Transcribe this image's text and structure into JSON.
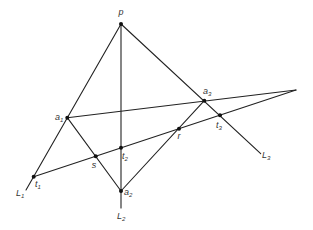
{
  "diagram": {
    "type": "projective-geometry-construction",
    "points": [
      {
        "id": "p",
        "label": "p",
        "sub": "",
        "x": 121,
        "y": 24,
        "lx": 121,
        "ly": 15,
        "anchor": "middle"
      },
      {
        "id": "a1",
        "label": "a",
        "sub": "1",
        "x": 67.3,
        "y": 117.7,
        "lx": 55,
        "ly": 120,
        "anchor": "start"
      },
      {
        "id": "a2",
        "label": "a",
        "sub": "2",
        "x": 121,
        "y": 191,
        "lx": 124,
        "ly": 195,
        "anchor": "start"
      },
      {
        "id": "a3",
        "label": "a",
        "sub": "3",
        "x": 204.3,
        "y": 100.7,
        "lx": 203,
        "ly": 94,
        "anchor": "start"
      },
      {
        "id": "t1",
        "label": "t",
        "sub": "1",
        "x": 33.7,
        "y": 176.7,
        "lx": 35,
        "ly": 187,
        "anchor": "start"
      },
      {
        "id": "t2",
        "label": "t",
        "sub": "2",
        "x": 121,
        "y": 147.7,
        "lx": 122,
        "ly": 159,
        "anchor": "start"
      },
      {
        "id": "t3",
        "label": "t",
        "sub": "3",
        "x": 220,
        "y": 115.3,
        "lx": 216,
        "ly": 128,
        "anchor": "start"
      },
      {
        "id": "s",
        "label": "s",
        "sub": "",
        "x": 95.7,
        "y": 156.3,
        "lx": 94,
        "ly": 168,
        "anchor": "middle"
      },
      {
        "id": "r",
        "label": "r",
        "sub": "",
        "x": 179,
        "y": 128.7,
        "lx": 179,
        "ly": 139,
        "anchor": "middle"
      }
    ],
    "vertices": [
      {
        "id": "v",
        "x": 296,
        "y": 90
      }
    ],
    "line_ends": [
      {
        "id": "L1",
        "label": "L",
        "sub": "1",
        "x": 26,
        "y": 190,
        "lx": 16,
        "ly": 196,
        "anchor": "start"
      },
      {
        "id": "L2",
        "label": "L",
        "sub": "2",
        "x": 121,
        "y": 208,
        "lx": 117,
        "ly": 219,
        "anchor": "start"
      },
      {
        "id": "L3",
        "label": "L",
        "sub": "3",
        "x": 260.7,
        "y": 153.7,
        "lx": 262,
        "ly": 158,
        "anchor": "start"
      }
    ],
    "segments": [
      {
        "name": "line-L1",
        "from": "p",
        "to": "L1"
      },
      {
        "name": "line-L2",
        "from": "p",
        "to": "L2"
      },
      {
        "name": "line-L3",
        "from": "p",
        "to": "L3"
      },
      {
        "name": "line-a1-vertex",
        "from": "a1",
        "to": "v"
      },
      {
        "name": "line-t1-vertex",
        "from": "t1",
        "to": "v"
      },
      {
        "name": "segment-a1-a2",
        "from": "a1",
        "to": "a2"
      },
      {
        "name": "segment-a2-a3",
        "from": "a2",
        "to": "a3"
      }
    ],
    "colors": {
      "line": "#222222",
      "point": "#111111",
      "label": "#333333",
      "background": "#ffffff"
    }
  }
}
